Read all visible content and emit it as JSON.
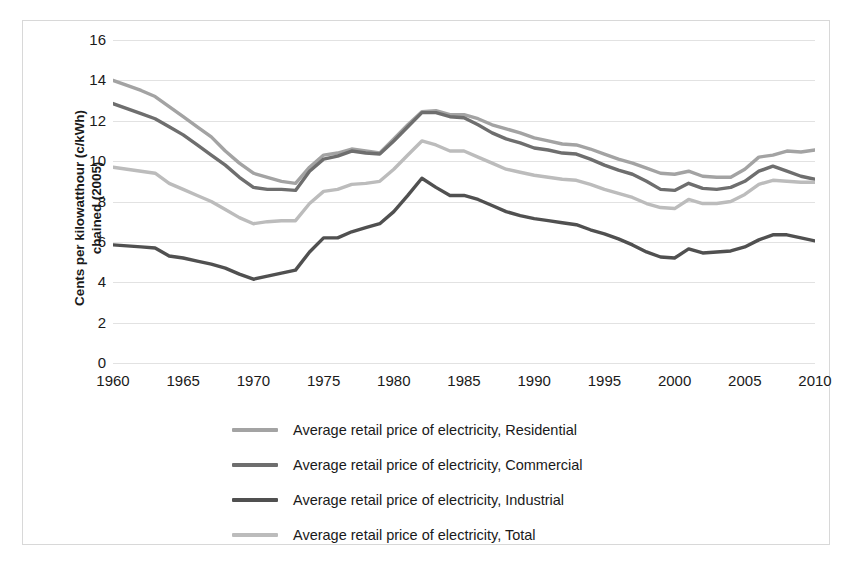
{
  "chart_data": {
    "type": "line",
    "title": "",
    "xlabel": "",
    "ylabel": "Cents per kilowatthour (c/kWh) chained (2005)",
    "ylabel_line1": "Cents per kilowatthour (c/kWh)",
    "ylabel_line2": "chained (2005)",
    "xlim": [
      1960,
      2010
    ],
    "ylim": [
      0,
      16
    ],
    "y_ticks": [
      0,
      2,
      4,
      6,
      8,
      10,
      12,
      14,
      16
    ],
    "x_ticks": [
      1960,
      1965,
      1970,
      1975,
      1980,
      1985,
      1990,
      1995,
      2000,
      2005,
      2010
    ],
    "grid": true,
    "legend_position": "bottom",
    "x": [
      1960,
      1961,
      1962,
      1963,
      1964,
      1965,
      1966,
      1967,
      1968,
      1969,
      1970,
      1971,
      1972,
      1973,
      1974,
      1975,
      1976,
      1977,
      1978,
      1979,
      1980,
      1981,
      1982,
      1983,
      1984,
      1985,
      1986,
      1987,
      1988,
      1989,
      1990,
      1991,
      1992,
      1993,
      1994,
      1995,
      1996,
      1997,
      1998,
      1999,
      2000,
      2001,
      2002,
      2003,
      2004,
      2005,
      2006,
      2007,
      2008,
      2009,
      2010
    ],
    "series": [
      {
        "name": "Average retail price of electricity, Residential",
        "color": "#a3a3a3",
        "values": [
          14.0,
          13.75,
          13.5,
          13.2,
          12.7,
          12.2,
          11.7,
          11.2,
          10.5,
          9.9,
          9.4,
          9.2,
          9.0,
          8.9,
          9.7,
          10.3,
          10.4,
          10.6,
          10.5,
          10.4,
          11.1,
          11.8,
          12.45,
          12.5,
          12.3,
          12.3,
          12.1,
          11.8,
          11.6,
          11.4,
          11.15,
          11.0,
          10.85,
          10.8,
          10.6,
          10.35,
          10.1,
          9.9,
          9.65,
          9.4,
          9.35,
          9.5,
          9.25,
          9.2,
          9.2,
          9.6,
          10.2,
          10.3,
          10.5,
          10.45,
          10.55
        ]
      },
      {
        "name": "Average retail price of electricity, Commercial",
        "color": "#6e6e6e",
        "values": [
          12.85,
          12.6,
          12.35,
          12.1,
          11.7,
          11.3,
          10.8,
          10.3,
          9.8,
          9.2,
          8.7,
          8.6,
          8.6,
          8.55,
          9.5,
          10.1,
          10.25,
          10.5,
          10.4,
          10.35,
          11.0,
          11.7,
          12.4,
          12.4,
          12.2,
          12.15,
          11.8,
          11.4,
          11.1,
          10.9,
          10.65,
          10.55,
          10.4,
          10.35,
          10.1,
          9.8,
          9.55,
          9.35,
          9.0,
          8.6,
          8.55,
          8.9,
          8.65,
          8.6,
          8.7,
          9.0,
          9.5,
          9.75,
          9.5,
          9.25,
          9.1
        ]
      },
      {
        "name": "Average retail price of electricity, Industrial",
        "color": "#505050",
        "values": [
          5.85,
          5.8,
          5.75,
          5.7,
          5.3,
          5.2,
          5.05,
          4.9,
          4.7,
          4.4,
          4.15,
          4.3,
          4.45,
          4.6,
          5.5,
          6.2,
          6.2,
          6.5,
          6.7,
          6.9,
          7.5,
          8.3,
          9.15,
          8.7,
          8.3,
          8.3,
          8.1,
          7.8,
          7.5,
          7.3,
          7.15,
          7.05,
          6.95,
          6.85,
          6.6,
          6.4,
          6.15,
          5.85,
          5.5,
          5.25,
          5.2,
          5.65,
          5.45,
          5.5,
          5.55,
          5.75,
          6.1,
          6.35,
          6.35,
          6.2,
          6.05
        ]
      },
      {
        "name": "Average retail price of electricity, Total",
        "color": "#bcbcbc",
        "values": [
          9.7,
          9.6,
          9.5,
          9.4,
          8.9,
          8.6,
          8.3,
          8.0,
          7.6,
          7.2,
          6.9,
          7.0,
          7.05,
          7.05,
          7.9,
          8.5,
          8.6,
          8.85,
          8.9,
          9.0,
          9.6,
          10.3,
          11.0,
          10.8,
          10.5,
          10.5,
          10.2,
          9.9,
          9.6,
          9.45,
          9.3,
          9.2,
          9.1,
          9.05,
          8.85,
          8.6,
          8.4,
          8.2,
          7.9,
          7.7,
          7.65,
          8.1,
          7.9,
          7.9,
          8.0,
          8.35,
          8.85,
          9.05,
          9.0,
          8.95,
          8.95
        ]
      }
    ]
  },
  "legend": {
    "items": [
      {
        "label": "Average retail price of electricity, Residential",
        "color": "#a3a3a3"
      },
      {
        "label": "Average retail price of electricity, Commercial",
        "color": "#6e6e6e"
      },
      {
        "label": "Average retail price of electricity, Industrial",
        "color": "#505050"
      },
      {
        "label": "Average retail price of electricity, Total",
        "color": "#bcbcbc"
      }
    ]
  }
}
